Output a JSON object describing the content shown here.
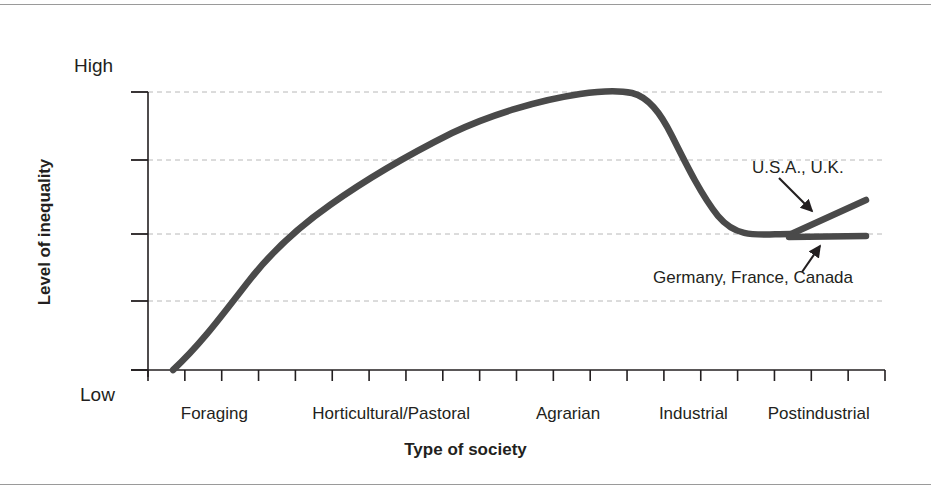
{
  "chart_data": {
    "type": "line",
    "title": "",
    "xlabel": "Type of society",
    "ylabel": "Level of inequality",
    "ytick_labels": [
      "High",
      "Low"
    ],
    "ylim_labels": {
      "top": "High",
      "bottom": "Low"
    },
    "grid": true,
    "grid_lines": 4,
    "legend_position": "inline-annotations",
    "categories": [
      "Foraging",
      "Horticultural/Pastoral",
      "Agrarian",
      "Industrial",
      "Postindustrial"
    ],
    "category_positions": [
      0.09,
      0.33,
      0.57,
      0.74,
      0.91
    ],
    "x_tick_count": 20,
    "series": [
      {
        "name": "Main trend",
        "points": [
          {
            "x": 0.03,
            "y": 0.0
          },
          {
            "x": 0.12,
            "y": 0.2
          },
          {
            "x": 0.22,
            "y": 0.38
          },
          {
            "x": 0.32,
            "y": 0.53
          },
          {
            "x": 0.43,
            "y": 0.68
          },
          {
            "x": 0.54,
            "y": 0.82
          },
          {
            "x": 0.65,
            "y": 0.93
          },
          {
            "x": 0.73,
            "y": 1.0
          },
          {
            "x": 0.79,
            "y": 0.98
          },
          {
            "x": 0.84,
            "y": 0.84
          },
          {
            "x": 0.88,
            "y": 0.64
          },
          {
            "x": 0.91,
            "y": 0.5
          },
          {
            "x": 0.935,
            "y": 0.47
          }
        ]
      },
      {
        "name": "U.S.A., U.K.",
        "points": [
          {
            "x": 0.935,
            "y": 0.47
          },
          {
            "x": 1.0,
            "y": 0.58
          }
        ]
      },
      {
        "name": "Germany, France, Canada",
        "points": [
          {
            "x": 0.935,
            "y": 0.47
          },
          {
            "x": 1.0,
            "y": 0.46
          }
        ]
      }
    ],
    "annotations": [
      {
        "text": "U.S.A., U.K.",
        "points_to": "upper-branch"
      },
      {
        "text": "Germany, France, Canada",
        "points_to": "flat-branch"
      }
    ],
    "colors": {
      "line": "#4a4a4a",
      "axis": "#231f20",
      "grid": "#b8b8b8",
      "text": "#231f20",
      "background": "#ffffff"
    }
  },
  "axes": {
    "y_title": "Level of inequality",
    "y_high": "High",
    "y_low": "Low",
    "x_title": "Type of society"
  },
  "categories": [
    {
      "label": "Foraging"
    },
    {
      "label": "Horticultural/Pastoral"
    },
    {
      "label": "Agrarian"
    },
    {
      "label": "Industrial"
    },
    {
      "label": "Postindustrial"
    }
  ],
  "annotations": {
    "usa_uk": "U.S.A., U.K.",
    "germany_france_canada": "Germany, France, Canada"
  }
}
